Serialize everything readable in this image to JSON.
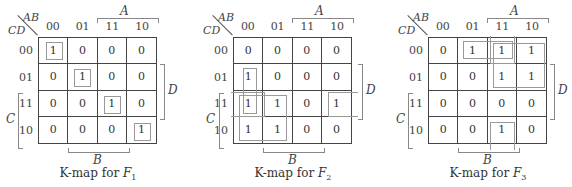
{
  "maps": [
    {
      "name": "F1",
      "caption_prefix": "K-map for ",
      "caption_var": "F",
      "caption_sub": "1",
      "col_var": "AB",
      "row_var": "CD",
      "col_labels": [
        "00",
        "01",
        "11",
        "10"
      ],
      "row_labels": [
        "00",
        "01",
        "11",
        "10"
      ],
      "cells": [
        [
          "1",
          "0",
          "0",
          "0"
        ],
        [
          "0",
          "1",
          "0",
          "0"
        ],
        [
          "0",
          "0",
          "1",
          "0"
        ],
        [
          "0",
          "0",
          "0",
          "1"
        ]
      ],
      "brackets": {
        "A": "A",
        "B": "B",
        "C": "C",
        "D": "D"
      },
      "groups": [
        {
          "desc": "m0 (row 00, col 00)"
        },
        {
          "desc": "m5 (row 01, col 01)"
        },
        {
          "desc": "m15 (row 11, col 11)"
        },
        {
          "desc": "m10 (row 10, col 10)"
        }
      ]
    },
    {
      "name": "F2",
      "caption_prefix": "K-map for ",
      "caption_var": "F",
      "caption_sub": "2",
      "col_var": "AB",
      "row_var": "CD",
      "col_labels": [
        "00",
        "01",
        "11",
        "10"
      ],
      "row_labels": [
        "00",
        "01",
        "11",
        "10"
      ],
      "cells": [
        [
          "0",
          "0",
          "0",
          "0"
        ],
        [
          "1",
          "0",
          "0",
          "0"
        ],
        [
          "1",
          "1",
          "0",
          "1"
        ],
        [
          "1",
          "1",
          "0",
          "0"
        ]
      ],
      "brackets": {
        "A": "A",
        "B": "B",
        "C": "C",
        "D": "D"
      },
      "groups": [
        {
          "desc": "col 00, rows 01-11 (pair)"
        },
        {
          "desc": "cols 00-01, rows 11-10 (quad)"
        },
        {
          "desc": "row 11, cols 00 and 10 wrap-around"
        }
      ]
    },
    {
      "name": "F3",
      "caption_prefix": "K-map for ",
      "caption_var": "F",
      "caption_sub": "3",
      "col_var": "AB",
      "row_var": "CD",
      "col_labels": [
        "00",
        "01",
        "11",
        "10"
      ],
      "row_labels": [
        "00",
        "01",
        "11",
        "10"
      ],
      "cells": [
        [
          "0",
          "1",
          "1",
          "1"
        ],
        [
          "0",
          "0",
          "1",
          "1"
        ],
        [
          "0",
          "0",
          "0",
          "0"
        ],
        [
          "0",
          "0",
          "1",
          "0"
        ]
      ],
      "brackets": {
        "A": "A",
        "B": "B",
        "C": "C",
        "D": "D"
      },
      "groups": [
        {
          "desc": "row 00, cols 01-11 (pair)"
        },
        {
          "desc": "cols 11-10, rows 00-01 (quad)"
        },
        {
          "desc": "col 11, rows 00 and 10 wrap-around"
        }
      ]
    }
  ]
}
